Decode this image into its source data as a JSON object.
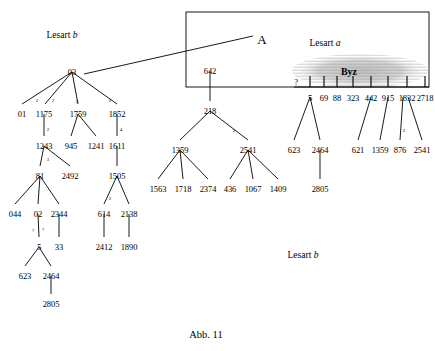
{
  "figure": {
    "caption": "Abb. 11",
    "caption_pos": [
      206,
      330
    ]
  },
  "labels": [
    {
      "name": "lesart-b-top-left",
      "text": "Lesart ",
      "italic": "b",
      "x": 62,
      "y": 31
    },
    {
      "name": "lesart-a-box",
      "text": "Lesart ",
      "italic": "a",
      "x": 325,
      "y": 39
    },
    {
      "name": "lesart-b-bottom-right",
      "text": "Lesart ",
      "italic": "b",
      "x": 303,
      "y": 251
    }
  ],
  "markers": {
    "big_a": {
      "text": "A",
      "x": 262,
      "y": 33
    },
    "byz": {
      "text": "Byz",
      "x": 349,
      "y": 67
    }
  },
  "box": {
    "x": 186,
    "y": 12,
    "w": 243,
    "h": 75
  },
  "byz_ellipse": {
    "cx": 360,
    "cy": 71,
    "rx": 68,
    "ry": 17
  },
  "connector": {
    "x1": 84,
    "y1": 74,
    "x2": 253,
    "y2": 36
  },
  "byz_axis": {
    "y": 87,
    "x1": 294,
    "x2": 429
  },
  "byz_ticks": [
    {
      "label": "?",
      "x": 296,
      "label_y": 78,
      "tick_top": 82,
      "tick_bot": 87,
      "has_tick": false
    },
    {
      "label": "5",
      "x": 310,
      "label_y": 94,
      "tick_top": 76,
      "tick_bot": 87,
      "has_tick": true
    },
    {
      "label": "69",
      "x": 324,
      "label_y": 94,
      "tick_top": 76,
      "tick_bot": 87,
      "has_tick": true
    },
    {
      "label": "88",
      "x": 337,
      "label_y": 94,
      "tick_top": 76,
      "tick_bot": 87,
      "has_tick": true
    },
    {
      "label": "323",
      "x": 353,
      "label_y": 94,
      "tick_top": 76,
      "tick_bot": 87,
      "has_tick": true
    },
    {
      "label": "442",
      "x": 371,
      "label_y": 94,
      "tick_top": 76,
      "tick_bot": 87,
      "has_tick": true
    },
    {
      "label": "915",
      "x": 388,
      "label_y": 94,
      "tick_top": 76,
      "tick_bot": 87,
      "has_tick": true
    },
    {
      "label": "1832",
      "x": 407,
      "label_y": 94,
      "tick_top": 76,
      "tick_bot": 87,
      "has_tick": true
    },
    {
      "label": "2718",
      "x": 425,
      "label_y": 94,
      "tick_top": 76,
      "tick_bot": 87,
      "has_tick": true
    }
  ],
  "nodes": [
    {
      "name": "node-03",
      "label": "03",
      "x": 72,
      "y": 68
    },
    {
      "name": "node-01",
      "label": "01",
      "x": 22,
      "y": 110
    },
    {
      "name": "node-1175",
      "label": "1175",
      "x": 44,
      "y": 110
    },
    {
      "name": "node-1759",
      "label": "1759",
      "x": 78,
      "y": 110
    },
    {
      "name": "node-1852",
      "label": "1852",
      "x": 117,
      "y": 110
    },
    {
      "name": "node-1243",
      "label": "1243",
      "x": 44,
      "y": 142
    },
    {
      "name": "node-945",
      "label": "945",
      "x": 71,
      "y": 142
    },
    {
      "name": "node-1241",
      "label": "1241",
      "x": 96,
      "y": 142
    },
    {
      "name": "node-1611",
      "label": "1611",
      "x": 117,
      "y": 142
    },
    {
      "name": "node-81",
      "label": "81",
      "x": 40,
      "y": 172
    },
    {
      "name": "node-2492",
      "label": "2492",
      "x": 70,
      "y": 172
    },
    {
      "name": "node-1505",
      "label": "1505",
      "x": 117,
      "y": 172
    },
    {
      "name": "node-044",
      "label": "044",
      "x": 15,
      "y": 210
    },
    {
      "name": "node-02",
      "label": "02",
      "x": 38,
      "y": 210
    },
    {
      "name": "node-2344",
      "label": "2344",
      "x": 59,
      "y": 210
    },
    {
      "name": "node-614",
      "label": "614",
      "x": 104,
      "y": 210
    },
    {
      "name": "node-2138",
      "label": "2138",
      "x": 129,
      "y": 210
    },
    {
      "name": "node-5-left",
      "label": "5",
      "x": 39,
      "y": 243
    },
    {
      "name": "node-33",
      "label": "33",
      "x": 59,
      "y": 243
    },
    {
      "name": "node-2412",
      "label": "2412",
      "x": 104,
      "y": 243
    },
    {
      "name": "node-1890",
      "label": "1890",
      "x": 129,
      "y": 243
    },
    {
      "name": "node-623-left",
      "label": "623",
      "x": 25,
      "y": 272
    },
    {
      "name": "node-2464-left",
      "label": "2464",
      "x": 51,
      "y": 272
    },
    {
      "name": "node-2805-left",
      "label": "2805",
      "x": 51,
      "y": 300
    },
    {
      "name": "node-642",
      "label": "642",
      "x": 210,
      "y": 67
    },
    {
      "name": "node-218",
      "label": "218",
      "x": 210,
      "y": 107
    },
    {
      "name": "node-1359-mid",
      "label": "1359",
      "x": 180,
      "y": 146
    },
    {
      "name": "node-2541-mid",
      "label": "2541",
      "x": 248,
      "y": 146
    },
    {
      "name": "node-1563",
      "label": "1563",
      "x": 158,
      "y": 185
    },
    {
      "name": "node-1718",
      "label": "1718",
      "x": 183,
      "y": 185
    },
    {
      "name": "node-2374",
      "label": "2374",
      "x": 208,
      "y": 185
    },
    {
      "name": "node-436",
      "label": "436",
      "x": 230,
      "y": 185
    },
    {
      "name": "node-1067",
      "label": "1067",
      "x": 253,
      "y": 185
    },
    {
      "name": "node-1409",
      "label": "1409",
      "x": 278,
      "y": 185
    },
    {
      "name": "node-623-mid",
      "label": "623",
      "x": 294,
      "y": 146
    },
    {
      "name": "node-2464-mid",
      "label": "2464",
      "x": 320,
      "y": 146
    },
    {
      "name": "node-2805-mid",
      "label": "2805",
      "x": 320,
      "y": 185
    },
    {
      "name": "node-621",
      "label": "621",
      "x": 358,
      "y": 146
    },
    {
      "name": "node-1359-right",
      "label": "1359",
      "x": 380,
      "y": 146
    },
    {
      "name": "node-876",
      "label": "876",
      "x": 400,
      "y": 146
    },
    {
      "name": "node-2541-right",
      "label": "2541",
      "x": 422,
      "y": 146
    }
  ],
  "edge_labels": [
    {
      "name": "edge-label-03-01",
      "text": "2",
      "x": 37,
      "y": 98
    },
    {
      "name": "edge-label-03-1175",
      "text": "2",
      "x": 53,
      "y": 98
    },
    {
      "name": "edge-label-03-1759",
      "text": "2",
      "x": 77,
      "y": 99
    },
    {
      "name": "edge-label-03-1852",
      "text": "2",
      "x": 110,
      "y": 98
    },
    {
      "name": "edge-label-1175-1243",
      "text": "2",
      "x": 48,
      "y": 127
    },
    {
      "name": "edge-label-1852-1611",
      "text": "4",
      "x": 121,
      "y": 127
    },
    {
      "name": "edge-label-1243-81",
      "text": "3",
      "x": 48,
      "y": 157
    },
    {
      "name": "edge-label-1505-614",
      "text": "2",
      "x": 110,
      "y": 196
    },
    {
      "name": "edge-label-02-5-a",
      "text": "?",
      "x": 33,
      "y": 228
    },
    {
      "name": "edge-label-02-5-b",
      "text": "?",
      "x": 43,
      "y": 227
    },
    {
      "name": "edge-label-218-2541",
      "text": "2",
      "x": 234,
      "y": 128
    },
    {
      "name": "edge-label-1832-876",
      "text": "2",
      "x": 404,
      "y": 128
    }
  ],
  "edges": [
    {
      "name": "edge-03-01",
      "x1": 72,
      "y1": 72,
      "x2": 22,
      "y2": 104
    },
    {
      "name": "edge-03-1175",
      "x1": 72,
      "y1": 72,
      "x2": 45,
      "y2": 104
    },
    {
      "name": "edge-03-1759",
      "x1": 72,
      "y1": 72,
      "x2": 78,
      "y2": 104
    },
    {
      "name": "edge-03-1852",
      "x1": 72,
      "y1": 72,
      "x2": 117,
      "y2": 104
    },
    {
      "name": "edge-1175-1243",
      "x1": 44,
      "y1": 114,
      "x2": 44,
      "y2": 136
    },
    {
      "name": "edge-1759-945",
      "x1": 78,
      "y1": 114,
      "x2": 71,
      "y2": 136
    },
    {
      "name": "edge-1759-1241",
      "x1": 78,
      "y1": 114,
      "x2": 96,
      "y2": 136
    },
    {
      "name": "edge-1852-1611",
      "x1": 117,
      "y1": 114,
      "x2": 117,
      "y2": 136
    },
    {
      "name": "edge-1243-81",
      "x1": 44,
      "y1": 146,
      "x2": 40,
      "y2": 166
    },
    {
      "name": "edge-1243-2492",
      "x1": 44,
      "y1": 146,
      "x2": 70,
      "y2": 166
    },
    {
      "name": "edge-1611-1505",
      "x1": 117,
      "y1": 146,
      "x2": 117,
      "y2": 166
    },
    {
      "name": "edge-81-044",
      "x1": 40,
      "y1": 176,
      "x2": 15,
      "y2": 204
    },
    {
      "name": "edge-81-02",
      "x1": 40,
      "y1": 176,
      "x2": 38,
      "y2": 204
    },
    {
      "name": "edge-81-2344",
      "x1": 40,
      "y1": 176,
      "x2": 59,
      "y2": 204
    },
    {
      "name": "edge-1505-614",
      "x1": 117,
      "y1": 176,
      "x2": 104,
      "y2": 204
    },
    {
      "name": "edge-1505-2138",
      "x1": 117,
      "y1": 176,
      "x2": 129,
      "y2": 204
    },
    {
      "name": "edge-02-5",
      "x1": 38,
      "y1": 214,
      "x2": 39,
      "y2": 237
    },
    {
      "name": "edge-2344-33",
      "x1": 59,
      "y1": 214,
      "x2": 59,
      "y2": 237
    },
    {
      "name": "edge-614-2412",
      "x1": 104,
      "y1": 214,
      "x2": 104,
      "y2": 237
    },
    {
      "name": "edge-2138-1890",
      "x1": 129,
      "y1": 214,
      "x2": 129,
      "y2": 237
    },
    {
      "name": "edge-5-623",
      "x1": 39,
      "y1": 247,
      "x2": 25,
      "y2": 266
    },
    {
      "name": "edge-5-2464",
      "x1": 39,
      "y1": 247,
      "x2": 51,
      "y2": 266
    },
    {
      "name": "edge-2464-2805",
      "x1": 51,
      "y1": 276,
      "x2": 51,
      "y2": 294
    },
    {
      "name": "edge-642-218",
      "x1": 210,
      "y1": 71,
      "x2": 210,
      "y2": 101
    },
    {
      "name": "edge-218-1359",
      "x1": 210,
      "y1": 111,
      "x2": 180,
      "y2": 140
    },
    {
      "name": "edge-218-2541",
      "x1": 210,
      "y1": 111,
      "x2": 248,
      "y2": 140
    },
    {
      "name": "edge-1359-1563",
      "x1": 180,
      "y1": 150,
      "x2": 158,
      "y2": 179
    },
    {
      "name": "edge-1359-1718",
      "x1": 180,
      "y1": 150,
      "x2": 183,
      "y2": 179
    },
    {
      "name": "edge-1359-2374",
      "x1": 180,
      "y1": 150,
      "x2": 208,
      "y2": 179
    },
    {
      "name": "edge-2541-436",
      "x1": 248,
      "y1": 150,
      "x2": 230,
      "y2": 179
    },
    {
      "name": "edge-2541-1067",
      "x1": 248,
      "y1": 150,
      "x2": 253,
      "y2": 179
    },
    {
      "name": "edge-2541-1409",
      "x1": 248,
      "y1": 150,
      "x2": 278,
      "y2": 179
    },
    {
      "name": "edge-5byz-623",
      "x1": 310,
      "y1": 97,
      "x2": 294,
      "y2": 140
    },
    {
      "name": "edge-5byz-2464",
      "x1": 310,
      "y1": 97,
      "x2": 320,
      "y2": 140
    },
    {
      "name": "edge-2464-2805-mid",
      "x1": 320,
      "y1": 150,
      "x2": 320,
      "y2": 179
    },
    {
      "name": "edge-442-621",
      "x1": 371,
      "y1": 97,
      "x2": 358,
      "y2": 140
    },
    {
      "name": "edge-915-1359",
      "x1": 388,
      "y1": 97,
      "x2": 380,
      "y2": 140
    },
    {
      "name": "edge-1832-876",
      "x1": 403,
      "y1": 97,
      "x2": 400,
      "y2": 140
    },
    {
      "name": "edge-1832-2541",
      "x1": 408,
      "y1": 97,
      "x2": 422,
      "y2": 140
    }
  ]
}
